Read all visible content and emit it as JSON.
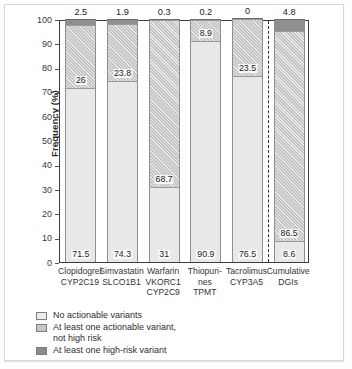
{
  "chart_data": {
    "type": "bar",
    "subtype": "stacked-bar",
    "title": "",
    "xlabel": "",
    "ylabel": "Frequency (%)",
    "ylim": [
      0,
      100
    ],
    "yticks": [
      0,
      10,
      20,
      30,
      40,
      50,
      60,
      70,
      80,
      90,
      100
    ],
    "grid": false,
    "legend_position": "below-axis-left",
    "categories": [
      "Clopidogrel CYP2C19",
      "Simvastatin SLCO1B1",
      "Warfarin VKORC1 CYP2C9",
      "Thiopurines TPMT",
      "Tacrolimus CYP3A5",
      "Cumulative DGIs"
    ],
    "category_lines": [
      [
        "Clopidogrel",
        "CYP2C19"
      ],
      [
        "Simvastatin",
        "SLCO1B1"
      ],
      [
        "Warfarin",
        "VKORC1",
        "CYP2C9"
      ],
      [
        "Thiopuri-",
        "nes",
        "TPMT"
      ],
      [
        "Tacrolimus",
        "CYP3A5"
      ],
      [
        "Cumulative",
        "DGIs"
      ]
    ],
    "series": [
      {
        "name": "No actionable variants",
        "values": [
          71.5,
          74.3,
          31,
          90.9,
          76.5,
          8.6
        ]
      },
      {
        "name": "At least one actionable variant, not high risk",
        "values": [
          26,
          23.8,
          68.7,
          8.9,
          23.5,
          86.5
        ]
      },
      {
        "name": "At least one high-risk variant",
        "values": [
          2.5,
          1.9,
          0.3,
          0.2,
          0,
          4.8
        ]
      }
    ],
    "top_annotations": [
      "2.5",
      "1.9",
      "0.3",
      "0.2",
      "0",
      "4.8"
    ],
    "annotations": {
      "divider": "dashed vertical separator before Cumulative DGIs"
    }
  },
  "axis": {
    "ylabel": "Frequency (%)",
    "ytick_labels": [
      "100",
      "90",
      "80",
      "70",
      "60",
      "50",
      "40",
      "30",
      "20",
      "10",
      "0"
    ]
  },
  "legend": {
    "items": [
      {
        "label": "No actionable variants",
        "swatch": "none-swatch",
        "color": "#ececec"
      },
      {
        "label": "At least one actionable variant,",
        "label2": "not high risk",
        "swatch": "actionable-swatch",
        "color": "#b9b9b9"
      },
      {
        "label": "At least one high-risk variant",
        "swatch": "high-risk-swatch",
        "color": "#8c8c8c"
      }
    ]
  },
  "bars": [
    {
      "id": "clopidogrel",
      "lines": [
        "Clopidogrel",
        "CYP2C19"
      ],
      "base": "71.5",
      "mid": "26",
      "top": "2.5",
      "base_v": 71.5,
      "mid_v": 26,
      "top_v": 2.5
    },
    {
      "id": "simvastatin",
      "lines": [
        "Simvastatin",
        "SLCO1B1"
      ],
      "base": "74.3",
      "mid": "23.8",
      "top": "1.9",
      "base_v": 74.3,
      "mid_v": 23.8,
      "top_v": 1.9
    },
    {
      "id": "warfarin",
      "lines": [
        "Warfarin",
        "VKORC1",
        "CYP2C9"
      ],
      "base": "31",
      "mid": "68.7",
      "top": "0.3",
      "base_v": 31,
      "mid_v": 68.7,
      "top_v": 0.3
    },
    {
      "id": "thiopurines",
      "lines": [
        "Thiopuri-",
        "nes",
        "TPMT"
      ],
      "base": "90.9",
      "mid": "8.9",
      "top": "0.2",
      "base_v": 90.9,
      "mid_v": 8.9,
      "top_v": 0.2
    },
    {
      "id": "tacrolimus",
      "lines": [
        "Tacrolimus",
        "CYP3A5"
      ],
      "base": "76.5",
      "mid": "23.5",
      "top": "0",
      "base_v": 76.5,
      "mid_v": 23.5,
      "top_v": 0
    },
    {
      "id": "cumulative-dgis",
      "lines": [
        "Cumulative",
        "DGIs"
      ],
      "base": "8.6",
      "mid": "86.5",
      "top": "4.8",
      "base_v": 8.6,
      "mid_v": 86.5,
      "top_v": 4.8
    }
  ],
  "colors": {
    "no_actionable": "#e8e8e8",
    "actionable": "#c3c3c3",
    "high_risk": "#8f8f8f",
    "axis": "#3d3d3d",
    "text": "#1f1f1f"
  }
}
